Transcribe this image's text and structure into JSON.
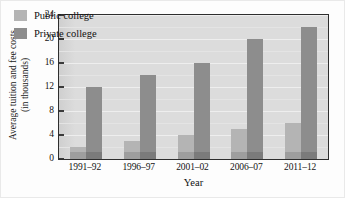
{
  "chart_data": {
    "type": "bar",
    "title": "",
    "xlabel": "Year",
    "ylabel_line1": "Average tuition and fee costs",
    "ylabel_line2": "(in thousands)",
    "categories": [
      "1991–92",
      "1996–97",
      "2001–02",
      "2006–07",
      "2011–12"
    ],
    "series": [
      {
        "name": "Public college",
        "color": "#b4b4b4",
        "values": [
          2,
          3,
          4,
          5,
          6
        ]
      },
      {
        "name": "Private college",
        "color": "#8d8d8d",
        "values": [
          12,
          14,
          16,
          20,
          22
        ]
      }
    ],
    "ylim": [
      0,
      24
    ],
    "yticks": [
      0,
      4,
      8,
      12,
      16,
      20,
      24
    ],
    "ytick_labels": [
      "0",
      "4",
      "8",
      "12",
      "16",
      "20",
      "24"
    ],
    "grid": "horizontal",
    "legend_position": "top-left-inside",
    "plot_background": "#dcdcdc",
    "axis_color": "#2e2e2e"
  }
}
